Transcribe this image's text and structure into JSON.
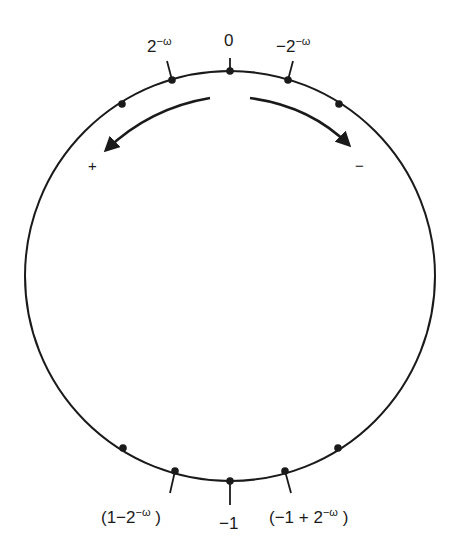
{
  "diagram": {
    "type": "number-circle",
    "circle": {
      "cx": 230,
      "cy": 276,
      "r": 205,
      "stroke": "#1a1a1a"
    },
    "labels": {
      "top": "0",
      "top_left_base": "2",
      "top_left_exp": "−ω",
      "top_right_base": "−2",
      "top_right_exp": "−ω",
      "bottom": "−1",
      "bottom_left_pre": "(1−2",
      "bottom_left_exp": "−ω",
      "bottom_left_post": ")",
      "bottom_right_pre": "(−1 + 2",
      "bottom_right_exp": "−ω",
      "bottom_right_post": ")"
    },
    "directions": {
      "left_sign": "+",
      "right_sign": "−"
    },
    "points": [
      {
        "x": 122,
        "y": 104,
        "labeled": false
      },
      {
        "x": 172,
        "y": 80,
        "labeled": true,
        "label": "2^−ω"
      },
      {
        "x": 230,
        "y": 71,
        "labeled": true,
        "label": "0"
      },
      {
        "x": 288,
        "y": 80,
        "labeled": true,
        "label": "−2^−ω"
      },
      {
        "x": 339,
        "y": 104,
        "labeled": false
      },
      {
        "x": 123,
        "y": 448,
        "labeled": false
      },
      {
        "x": 175,
        "y": 471,
        "labeled": true,
        "label": "(1−2^−ω)"
      },
      {
        "x": 230,
        "y": 481,
        "labeled": true,
        "label": "−1"
      },
      {
        "x": 285,
        "y": 471,
        "labeled": true,
        "label": "(−1 + 2^−ω)"
      },
      {
        "x": 338,
        "y": 448,
        "labeled": false
      }
    ]
  }
}
